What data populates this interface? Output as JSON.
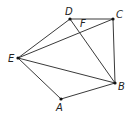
{
  "figure": {
    "title": "",
    "points": {
      "A": {
        "label": "A",
        "x": 61,
        "y": 99,
        "lx": 56,
        "ly": 111
      },
      "B": {
        "label": "B",
        "x": 115,
        "y": 83,
        "lx": 118,
        "ly": 90
      },
      "C": {
        "label": "C",
        "x": 113,
        "y": 19,
        "lx": 116,
        "ly": 18
      },
      "D": {
        "label": "D",
        "x": 70,
        "y": 19,
        "lx": 65,
        "ly": 15
      },
      "E": {
        "label": "E",
        "x": 18,
        "y": 58,
        "lx": 8,
        "ly": 62
      },
      "F": {
        "label": "F",
        "x": 79,
        "y": 28,
        "lx": 80,
        "ly": 27
      }
    },
    "segments": [
      [
        "E",
        "D"
      ],
      [
        "D",
        "C"
      ],
      [
        "C",
        "B"
      ],
      [
        "B",
        "A"
      ],
      [
        "A",
        "E"
      ],
      [
        "E",
        "C"
      ],
      [
        "E",
        "B"
      ],
      [
        "D",
        "B"
      ]
    ],
    "colors": {
      "line": "#3a3a3a",
      "point": "#111111"
    }
  }
}
